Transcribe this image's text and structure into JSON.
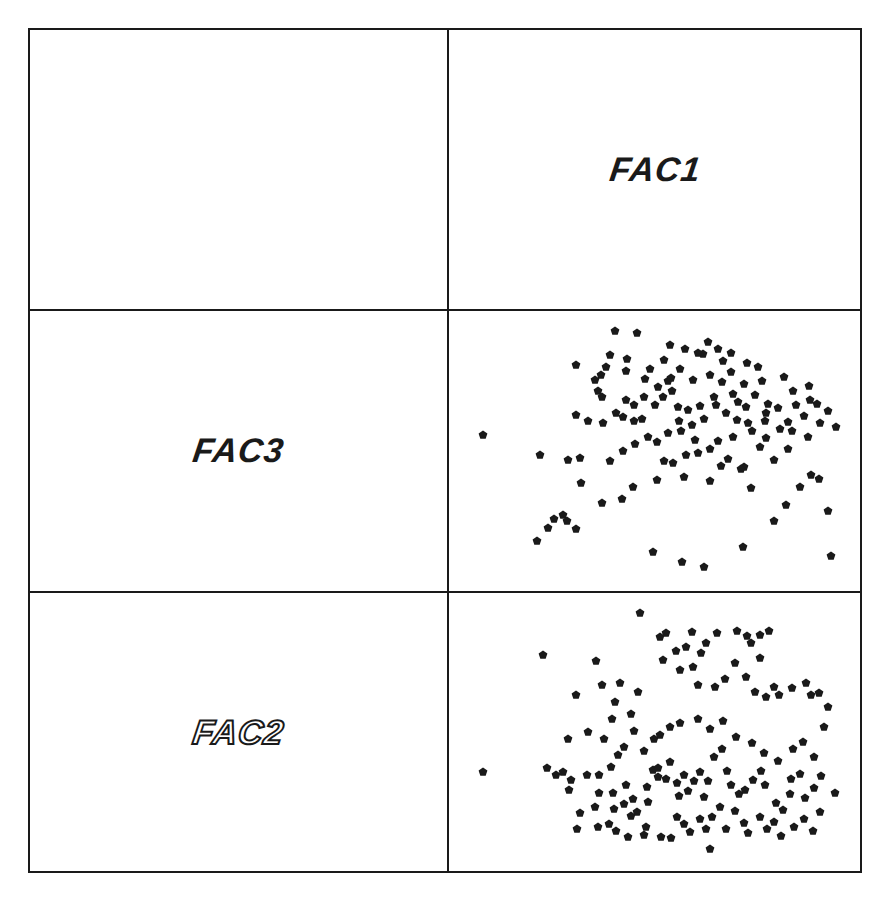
{
  "chart_data": {
    "type": "scatter",
    "layout": "scatterplot-matrix",
    "rows": 3,
    "cols": 2,
    "grid": false,
    "legend": "none",
    "marker": "filled-pentagon",
    "marker_color": "#1a1a1a",
    "variables": [
      "FAC1",
      "FAC3",
      "FAC2"
    ],
    "cells": [
      {
        "row": 0,
        "col": 0,
        "type": "empty"
      },
      {
        "row": 0,
        "col": 1,
        "type": "label",
        "text": "FAC1",
        "style": "bold-italic"
      },
      {
        "row": 1,
        "col": 0,
        "type": "label",
        "text": "FAC3",
        "style": "bold-italic"
      },
      {
        "row": 1,
        "col": 1,
        "type": "scatter",
        "x": "FAC1",
        "y": "FAC3"
      },
      {
        "row": 2,
        "col": 0,
        "type": "label",
        "text": "FAC2",
        "style": "outline-italic"
      },
      {
        "row": 2,
        "col": 1,
        "type": "scatter",
        "x": "FAC1",
        "y": "FAC2"
      }
    ],
    "panel_size": [
      416,
      282
    ],
    "scatter_fac1_fac3": [
      [
        35,
        126
      ],
      [
        92,
        146
      ],
      [
        120,
        151
      ],
      [
        132,
        149
      ],
      [
        128,
        56
      ],
      [
        189,
        24
      ],
      [
        167,
        22
      ],
      [
        150,
        82
      ],
      [
        158,
        58
      ],
      [
        162,
        46
      ],
      [
        179,
        50
      ],
      [
        147,
        71
      ],
      [
        153,
        66
      ],
      [
        178,
        62
      ],
      [
        154,
        88
      ],
      [
        178,
        91
      ],
      [
        197,
        70
      ],
      [
        220,
        72
      ],
      [
        215,
        88
      ],
      [
        140,
        112
      ],
      [
        128,
        106
      ],
      [
        155,
        114
      ],
      [
        168,
        104
      ],
      [
        175,
        108
      ],
      [
        186,
        112
      ],
      [
        210,
        78
      ],
      [
        223,
        69
      ],
      [
        232,
        60
      ],
      [
        245,
        71
      ],
      [
        262,
        66
      ],
      [
        255,
        45
      ],
      [
        216,
        51
      ],
      [
        222,
        36
      ],
      [
        237,
        40
      ],
      [
        250,
        44
      ],
      [
        270,
        40
      ],
      [
        283,
        44
      ],
      [
        260,
        33
      ],
      [
        275,
        52
      ],
      [
        283,
        63
      ],
      [
        299,
        54
      ],
      [
        310,
        58
      ],
      [
        314,
        72
      ],
      [
        296,
        75
      ],
      [
        307,
        86
      ],
      [
        290,
        93
      ],
      [
        268,
        96
      ],
      [
        278,
        104
      ],
      [
        289,
        111
      ],
      [
        300,
        114
      ],
      [
        318,
        104
      ],
      [
        330,
        99
      ],
      [
        256,
        110
      ],
      [
        244,
        116
      ],
      [
        233,
        122
      ],
      [
        220,
        124
      ],
      [
        200,
        128
      ],
      [
        187,
        135
      ],
      [
        175,
        142
      ],
      [
        162,
        152
      ],
      [
        216,
        152
      ],
      [
        238,
        146
      ],
      [
        250,
        144
      ],
      [
        262,
        140
      ],
      [
        280,
        150
      ],
      [
        296,
        158
      ],
      [
        312,
        138
      ],
      [
        326,
        151
      ],
      [
        340,
        140
      ],
      [
        344,
        122
      ],
      [
        356,
        107
      ],
      [
        362,
        91
      ],
      [
        336,
        68
      ],
      [
        345,
        82
      ],
      [
        320,
        95
      ],
      [
        317,
        112
      ],
      [
        332,
        120
      ],
      [
        360,
        128
      ],
      [
        372,
        114
      ],
      [
        380,
        102
      ],
      [
        388,
        118
      ],
      [
        352,
        178
      ],
      [
        338,
        196
      ],
      [
        326,
        212
      ],
      [
        303,
        179
      ],
      [
        293,
        160
      ],
      [
        273,
        157
      ],
      [
        262,
        172
      ],
      [
        236,
        168
      ],
      [
        225,
        154
      ],
      [
        209,
        171
      ],
      [
        185,
        178
      ],
      [
        174,
        190
      ],
      [
        154,
        194
      ],
      [
        133,
        174
      ],
      [
        115,
        206
      ],
      [
        119,
        212
      ],
      [
        106,
        210
      ],
      [
        128,
        220
      ],
      [
        100,
        219
      ],
      [
        89,
        232
      ],
      [
        205,
        243
      ],
      [
        234,
        253
      ],
      [
        256,
        258
      ],
      [
        295,
        238
      ],
      [
        363,
        166
      ],
      [
        371,
        170
      ],
      [
        380,
        202
      ],
      [
        383,
        247
      ],
      [
        270,
        132
      ],
      [
        285,
        128
      ],
      [
        247,
        131
      ],
      [
        209,
        133
      ],
      [
        194,
        110
      ],
      [
        196,
        88
      ],
      [
        207,
        96
      ],
      [
        230,
        98
      ],
      [
        240,
        101
      ],
      [
        252,
        97
      ],
      [
        266,
        88
      ],
      [
        274,
        73
      ],
      [
        285,
        85
      ],
      [
        298,
        98
      ],
      [
        304,
        122
      ],
      [
        318,
        129
      ],
      [
        340,
        113
      ],
      [
        348,
        96
      ],
      [
        361,
        77
      ],
      [
        369,
        95
      ],
      [
        231,
        112
      ],
      [
        224,
        82
      ],
      [
        202,
        60
      ],
      [
        186,
        96
      ]
    ],
    "scatter_fac1_fac2": [
      [
        35,
        181
      ],
      [
        95,
        64
      ],
      [
        128,
        104
      ],
      [
        148,
        70
      ],
      [
        164,
        128
      ],
      [
        154,
        94
      ],
      [
        172,
        92
      ],
      [
        167,
        111
      ],
      [
        183,
        123
      ],
      [
        190,
        101
      ],
      [
        192,
        22
      ],
      [
        218,
        42
      ],
      [
        212,
        46
      ],
      [
        215,
        69
      ],
      [
        228,
        60
      ],
      [
        238,
        56
      ],
      [
        244,
        41
      ],
      [
        258,
        52
      ],
      [
        253,
        62
      ],
      [
        232,
        79
      ],
      [
        245,
        76
      ],
      [
        250,
        94
      ],
      [
        267,
        96
      ],
      [
        269,
        42
      ],
      [
        289,
        40
      ],
      [
        299,
        45
      ],
      [
        303,
        52
      ],
      [
        312,
        44
      ],
      [
        321,
        40
      ],
      [
        312,
        67
      ],
      [
        287,
        72
      ],
      [
        277,
        88
      ],
      [
        298,
        86
      ],
      [
        307,
        101
      ],
      [
        318,
        106
      ],
      [
        326,
        96
      ],
      [
        331,
        104
      ],
      [
        344,
        97
      ],
      [
        358,
        92
      ],
      [
        363,
        104
      ],
      [
        371,
        102
      ],
      [
        380,
        116
      ],
      [
        376,
        136
      ],
      [
        99,
        177
      ],
      [
        108,
        184
      ],
      [
        115,
        181
      ],
      [
        123,
        189
      ],
      [
        121,
        199
      ],
      [
        139,
        184
      ],
      [
        151,
        184
      ],
      [
        151,
        202
      ],
      [
        147,
        216
      ],
      [
        132,
        222
      ],
      [
        129,
        238
      ],
      [
        150,
        236
      ],
      [
        161,
        233
      ],
      [
        166,
        218
      ],
      [
        165,
        202
      ],
      [
        178,
        194
      ],
      [
        176,
        213
      ],
      [
        185,
        208
      ],
      [
        189,
        221
      ],
      [
        183,
        225
      ],
      [
        198,
        236
      ],
      [
        199,
        196
      ],
      [
        200,
        211
      ],
      [
        205,
        179
      ],
      [
        210,
        177
      ],
      [
        210,
        186
      ],
      [
        222,
        171
      ],
      [
        218,
        188
      ],
      [
        229,
        192
      ],
      [
        231,
        205
      ],
      [
        236,
        184
      ],
      [
        240,
        200
      ],
      [
        246,
        190
      ],
      [
        252,
        181
      ],
      [
        256,
        206
      ],
      [
        260,
        190
      ],
      [
        266,
        166
      ],
      [
        274,
        158
      ],
      [
        279,
        180
      ],
      [
        283,
        194
      ],
      [
        291,
        203
      ],
      [
        297,
        199
      ],
      [
        305,
        189
      ],
      [
        313,
        180
      ],
      [
        317,
        194
      ],
      [
        328,
        212
      ],
      [
        335,
        219
      ],
      [
        342,
        203
      ],
      [
        343,
        188
      ],
      [
        352,
        183
      ],
      [
        357,
        207
      ],
      [
        366,
        197
      ],
      [
        372,
        221
      ],
      [
        387,
        202
      ],
      [
        373,
        185
      ],
      [
        366,
        166
      ],
      [
        229,
        226
      ],
      [
        236,
        233
      ],
      [
        242,
        241
      ],
      [
        252,
        228
      ],
      [
        258,
        238
      ],
      [
        264,
        226
      ],
      [
        272,
        216
      ],
      [
        278,
        238
      ],
      [
        287,
        220
      ],
      [
        296,
        232
      ],
      [
        300,
        242
      ],
      [
        312,
        226
      ],
      [
        319,
        238
      ],
      [
        326,
        231
      ],
      [
        333,
        245
      ],
      [
        346,
        236
      ],
      [
        356,
        228
      ],
      [
        365,
        240
      ],
      [
        262,
        258
      ],
      [
        223,
        247
      ],
      [
        213,
        246
      ],
      [
        196,
        244
      ],
      [
        180,
        246
      ],
      [
        168,
        240
      ],
      [
        120,
        148
      ],
      [
        140,
        141
      ],
      [
        156,
        148
      ],
      [
        176,
        156
      ],
      [
        196,
        160
      ],
      [
        212,
        144
      ],
      [
        222,
        136
      ],
      [
        232,
        132
      ],
      [
        250,
        128
      ],
      [
        262,
        138
      ],
      [
        275,
        130
      ],
      [
        288,
        146
      ],
      [
        304,
        152
      ],
      [
        316,
        162
      ],
      [
        330,
        170
      ],
      [
        345,
        158
      ],
      [
        355,
        151
      ],
      [
        206,
        148
      ],
      [
        186,
        140
      ],
      [
        170,
        164
      ],
      [
        163,
        176
      ]
    ]
  },
  "labels": {
    "fac1": "FAC1",
    "fac3": "FAC3",
    "fac2": "FAC2"
  }
}
